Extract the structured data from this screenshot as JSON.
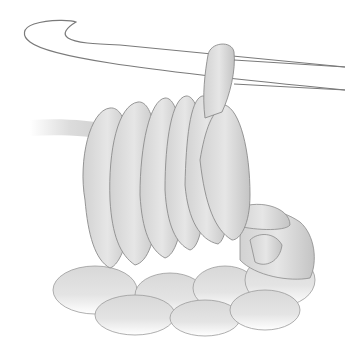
{
  "image": {
    "subject": "Crochet hook with yarn loops illustration",
    "colors": {
      "background": "#ffffff",
      "outline": "#808080",
      "yarn_light": "#e4e4e4",
      "yarn_mid": "#cfcfcf",
      "yarn_dark": "#b5b5b5"
    }
  }
}
